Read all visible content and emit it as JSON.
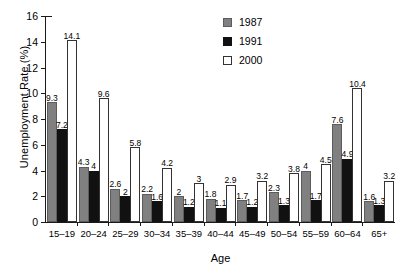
{
  "chart_data": {
    "type": "bar",
    "title": "",
    "xlabel": "Age",
    "ylabel": "Unemployment Rate (%)",
    "ylim": [
      0,
      16
    ],
    "yticks": [
      0,
      2,
      4,
      6,
      8,
      10,
      12,
      14,
      16
    ],
    "grid": false,
    "legend_position": "top-right",
    "categories": [
      "15–19",
      "20–24",
      "25–29",
      "30–34",
      "35–39",
      "40–44",
      "45–49",
      "50–54",
      "55–59",
      "60–64",
      "65+"
    ],
    "series": [
      {
        "name": "1987",
        "color": "#808080",
        "values": [
          9.3,
          4.3,
          2.6,
          2.2,
          2,
          1.8,
          1.7,
          2.3,
          4,
          7.6,
          1.6
        ],
        "labels": [
          "9.3",
          "4.3",
          "2.6",
          "2.2",
          "2",
          "1.8",
          "1.7",
          "2.3",
          "4",
          "7.6",
          "1.6"
        ]
      },
      {
        "name": "1991",
        "color": "#111111",
        "values": [
          7.2,
          4,
          2,
          1.6,
          1.2,
          1.1,
          1.2,
          1.3,
          1.7,
          4.9,
          1.3
        ],
        "labels": [
          "7.2",
          "4",
          "2",
          "1.6",
          "1.2",
          "1.1",
          "1.2",
          "1.3",
          "1.7",
          "4.9",
          "1.3"
        ]
      },
      {
        "name": "2000",
        "color": "#ffffff",
        "values": [
          14.1,
          9.6,
          5.8,
          4.2,
          3,
          2.9,
          3.2,
          3.8,
          4.5,
          10.4,
          3.2
        ],
        "labels": [
          "14.1",
          "9.6",
          "5.8",
          "4.2",
          "3",
          "2.9",
          "3.2",
          "3.8",
          "4.5",
          "10.4",
          "3.2"
        ]
      }
    ]
  },
  "legend": {
    "entries": [
      {
        "label": "1987"
      },
      {
        "label": "1991"
      },
      {
        "label": "2000"
      }
    ]
  }
}
